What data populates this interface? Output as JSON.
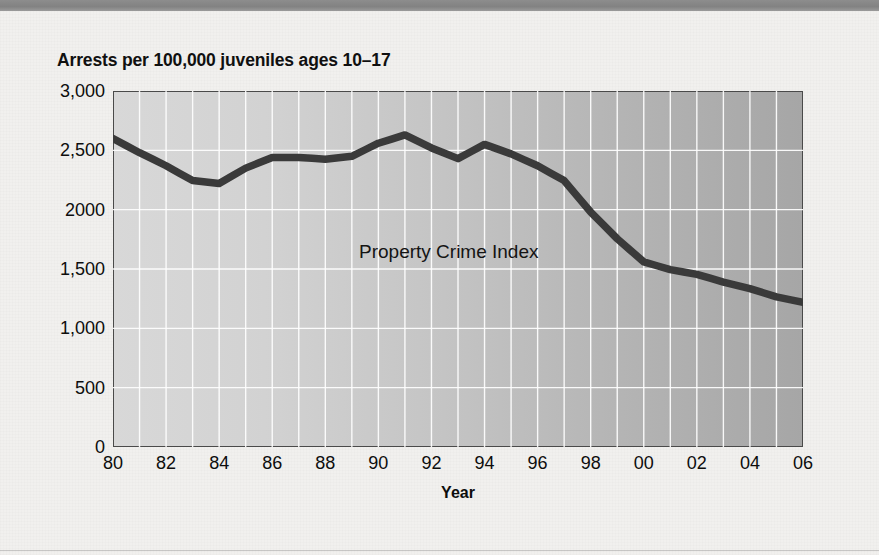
{
  "title": "Arrests per 100,000 juveniles ages 10–17",
  "axes": {
    "x_label": "Year",
    "y_ticks": [
      "3,000",
      "2,500",
      "2000",
      "1,500",
      "1,000",
      "500",
      "0"
    ],
    "x_ticks": [
      "80",
      "82",
      "84",
      "86",
      "88",
      "90",
      "92",
      "94",
      "96",
      "98",
      "00",
      "02",
      "04",
      "06"
    ]
  },
  "series_label": "Property Crime Index",
  "colors": {
    "line": "#3a3a3a",
    "plot_left": "#d8d8d8",
    "plot_right": "#a6a6a6",
    "gridline": "#ffffff",
    "axis_border": "#4a4a4a",
    "top_rule": "#868686",
    "page": "#f1f0ee",
    "text": "#0d0d0d"
  },
  "chart_data": {
    "type": "line",
    "title": "Arrests per 100,000 juveniles ages 10–17",
    "xlabel": "Year",
    "ylabel": "Arrests per 100,000 juveniles ages 10–17",
    "xlim": [
      1980,
      2006
    ],
    "ylim": [
      0,
      3000
    ],
    "ytick_values": [
      0,
      500,
      1000,
      1500,
      2000,
      2500,
      3000
    ],
    "xtick_values": [
      1980,
      1982,
      1984,
      1986,
      1988,
      1990,
      1992,
      1994,
      1996,
      1998,
      2000,
      2002,
      2004,
      2006
    ],
    "grid": true,
    "legend_position": "inline-annotation",
    "series": [
      {
        "name": "Property Crime Index",
        "x": [
          1980,
          1981,
          1982,
          1983,
          1984,
          1985,
          1986,
          1987,
          1988,
          1989,
          1990,
          1991,
          1992,
          1993,
          1994,
          1995,
          1996,
          1997,
          1998,
          1999,
          2000,
          2001,
          2002,
          2003,
          2004,
          2005,
          2006
        ],
        "values": [
          2600,
          2480,
          2370,
          2245,
          2220,
          2350,
          2440,
          2440,
          2425,
          2450,
          2560,
          2630,
          2520,
          2430,
          2550,
          2470,
          2370,
          2245,
          1980,
          1755,
          1560,
          1495,
          1455,
          1390,
          1335,
          1265,
          1220
        ]
      }
    ]
  }
}
